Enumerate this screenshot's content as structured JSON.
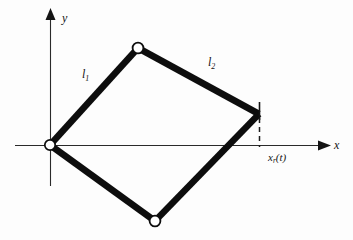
{
  "figure": {
    "background_color": "#fdfdfd",
    "stroke_color": "#141414",
    "link_color": "#0d0d0d",
    "joint_fill": "#ffffff"
  },
  "axes": {
    "x": {
      "label": "x",
      "origin_px": [
        50,
        145
      ],
      "end_px": [
        326,
        145
      ],
      "arrow": "right"
    },
    "y": {
      "label": "y",
      "origin_px": [
        50,
        145
      ],
      "end_px": [
        50,
        13
      ],
      "arrow": "up",
      "tail_px": [
        50,
        186
      ]
    }
  },
  "links": [
    {
      "name": "link-1",
      "label": "l",
      "subscript": "1",
      "from_px": [
        50,
        145
      ],
      "to_px": [
        138,
        48
      ]
    },
    {
      "name": "link-2",
      "label": "l",
      "subscript": "2",
      "from_px": [
        138,
        48
      ],
      "to_px": [
        258,
        114
      ]
    },
    {
      "name": "link-3",
      "label": "",
      "subscript": "",
      "from_px": [
        258,
        114
      ],
      "to_px": [
        155,
        221
      ]
    },
    {
      "name": "link-4",
      "label": "",
      "subscript": "",
      "from_px": [
        155,
        221
      ],
      "to_px": [
        50,
        145
      ]
    }
  ],
  "joints": [
    {
      "name": "joint-origin",
      "cx": 50,
      "cy": 145,
      "r": 5.2
    },
    {
      "name": "joint-top",
      "cx": 138,
      "cy": 48,
      "r": 5.4
    },
    {
      "name": "joint-bottom",
      "cx": 155,
      "cy": 221,
      "r": 5.4
    }
  ],
  "end_effector": {
    "name": "end-effector-vertex",
    "position_px": [
      258,
      114
    ],
    "tick_top_px": [
      259,
      103
    ],
    "tick_bottom_px": [
      259,
      120
    ],
    "dashed_drop_from_px": [
      259,
      118
    ],
    "dashed_drop_to_px": [
      259,
      146
    ]
  },
  "annotations": {
    "position_label": {
      "variable": "x",
      "subscript": "r",
      "argument": "(t)",
      "full": "x_r(t)"
    }
  }
}
